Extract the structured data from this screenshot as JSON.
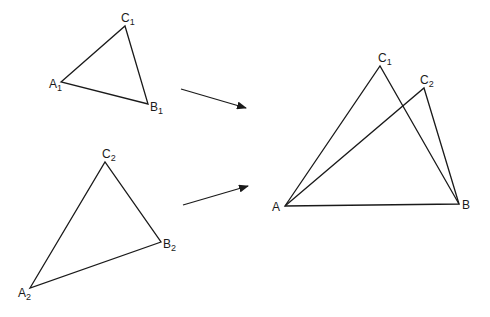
{
  "diagram": {
    "stroke_color": "#1a1a1a",
    "triangle1": {
      "vertices": {
        "A": [
          61,
          82
        ],
        "B": [
          148,
          104
        ],
        "C": [
          125,
          26
        ]
      },
      "labels": {
        "A": {
          "base": "A",
          "sub": "1"
        },
        "B": {
          "base": "B",
          "sub": "1"
        },
        "C": {
          "base": "C",
          "sub": "1"
        }
      }
    },
    "triangle2": {
      "vertices": {
        "A": [
          30,
          288
        ],
        "B": [
          161,
          242
        ],
        "C": [
          105,
          162
        ]
      },
      "labels": {
        "A": {
          "base": "A",
          "sub": "2"
        },
        "B": {
          "base": "B",
          "sub": "2"
        },
        "C": {
          "base": "C",
          "sub": "2"
        }
      }
    },
    "arrows": [
      {
        "from": [
          181,
          89
        ],
        "to": [
          246,
          108
        ]
      },
      {
        "from": [
          183,
          205
        ],
        "to": [
          248,
          186
        ]
      }
    ],
    "combined": {
      "vertices": {
        "A": [
          285,
          206
        ],
        "B": [
          459,
          204
        ],
        "C1": [
          380,
          66
        ],
        "C2": [
          424,
          88
        ]
      },
      "labels": {
        "A": {
          "base": "A",
          "sub": ""
        },
        "B": {
          "base": "B",
          "sub": ""
        },
        "C1": {
          "base": "C",
          "sub": "1"
        },
        "C2": {
          "base": "C",
          "sub": "2"
        }
      }
    }
  }
}
